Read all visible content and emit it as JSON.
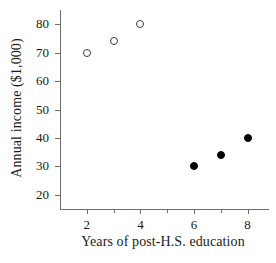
{
  "chart_data": {
    "type": "scatter",
    "title": "",
    "xlabel": "Years of post-H.S. education",
    "ylabel": "Annual income ($1,000)",
    "xlim": [
      1,
      8.8
    ],
    "ylim": [
      15,
      85
    ],
    "grid": false,
    "legend": "none",
    "xticks": [
      {
        "value": 2,
        "label": "2",
        "major": true
      },
      {
        "value": 3,
        "label": "",
        "major": false
      },
      {
        "value": 4,
        "label": "4",
        "major": true
      },
      {
        "value": 5,
        "label": "",
        "major": false
      },
      {
        "value": 6,
        "label": "6",
        "major": true
      },
      {
        "value": 7,
        "label": "",
        "major": false
      },
      {
        "value": 8,
        "label": "8",
        "major": true
      }
    ],
    "yticks": [
      {
        "value": 80,
        "label": "80"
      },
      {
        "value": 70,
        "label": "70"
      },
      {
        "value": 60,
        "label": "60"
      },
      {
        "value": 50,
        "label": "50"
      },
      {
        "value": 40,
        "label": "40"
      },
      {
        "value": 30,
        "label": "30"
      },
      {
        "value": 20,
        "label": "20"
      }
    ],
    "series": [
      {
        "name": "open-markers",
        "marker": "open-circle",
        "color": "#3a3a3a",
        "x": [
          2,
          3,
          4
        ],
        "y": [
          70,
          74,
          80
        ]
      },
      {
        "name": "filled-markers",
        "marker": "filled-circle",
        "color": "#000000",
        "x": [
          6,
          7,
          8
        ],
        "y": [
          30,
          34,
          40
        ]
      }
    ]
  }
}
